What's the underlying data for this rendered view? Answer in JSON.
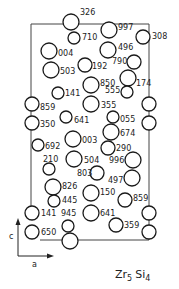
{
  "diagram": {
    "title": "Zr5Si4",
    "formula": {
      "el1": "Zr",
      "sub1": "5",
      "el2": "Si",
      "sub2": "4"
    },
    "axes": {
      "vertical": "c",
      "horizontal": "a"
    },
    "frame": {
      "x1": 31,
      "y1": 24,
      "x2": 149,
      "y2": 240
    },
    "atoms": [
      {
        "label": "326",
        "cx": 71,
        "cy": 22,
        "r": 8,
        "lx": 80,
        "ly": 15
      },
      {
        "label": "710",
        "cx": 74,
        "cy": 38,
        "r": 6,
        "lx": 82,
        "ly": 40
      },
      {
        "label": "997",
        "cx": 109,
        "cy": 30,
        "r": 8,
        "lx": 118,
        "ly": 30
      },
      {
        "label": "308",
        "cx": 143,
        "cy": 37,
        "r": 7,
        "lx": 152,
        "ly": 39
      },
      {
        "label": "496",
        "cx": 108,
        "cy": 50,
        "r": 8,
        "lx": 118,
        "ly": 50
      },
      {
        "label": "004",
        "cx": 49,
        "cy": 51,
        "r": 8,
        "lx": 58,
        "ly": 56
      },
      {
        "label": "503",
        "cx": 51,
        "cy": 70,
        "r": 8,
        "lx": 60,
        "ly": 74
      },
      {
        "label": "192",
        "cx": 85,
        "cy": 65,
        "r": 7,
        "lx": 92,
        "ly": 69
      },
      {
        "label": "790",
        "cx": 134,
        "cy": 62,
        "r": 7,
        "lx": 112,
        "ly": 64
      },
      {
        "label": "174",
        "cx": 128,
        "cy": 78,
        "r": 8,
        "lx": 136,
        "ly": 86
      },
      {
        "label": "850",
        "cx": 91,
        "cy": 85,
        "r": 8,
        "lx": 100,
        "ly": 86
      },
      {
        "label": "555",
        "cx": 127,
        "cy": 92,
        "r": 6,
        "lx": 105,
        "ly": 93
      },
      {
        "label": "141",
        "cx": 58,
        "cy": 93,
        "r": 6,
        "lx": 65,
        "ly": 96
      },
      {
        "label": "859",
        "cx": 32,
        "cy": 104,
        "r": 7,
        "lx": 40,
        "ly": 110
      },
      {
        "label": "355",
        "cx": 91,
        "cy": 104,
        "r": 8,
        "lx": 101,
        "ly": 108
      },
      {
        "label": "350",
        "cx": 32,
        "cy": 123,
        "r": 7,
        "lx": 40,
        "ly": 127
      },
      {
        "label": "641",
        "cx": 66,
        "cy": 117,
        "r": 6,
        "lx": 74,
        "ly": 123
      },
      {
        "label": "055",
        "cx": 113,
        "cy": 117,
        "r": 6,
        "lx": 120,
        "ly": 122
      },
      {
        "label": "674",
        "cx": 111,
        "cy": 132,
        "r": 8,
        "lx": 120,
        "ly": 136
      },
      {
        "label": "",
        "cx": 149,
        "cy": 104,
        "r": 7,
        "lx": 0,
        "ly": 0
      },
      {
        "label": "",
        "cx": 149,
        "cy": 123,
        "r": 7,
        "lx": 0,
        "ly": 0
      },
      {
        "label": "003",
        "cx": 73,
        "cy": 139,
        "r": 8,
        "lx": 82,
        "ly": 143
      },
      {
        "label": "692",
        "cx": 38,
        "cy": 145,
        "r": 6,
        "lx": 45,
        "ly": 149
      },
      {
        "label": "290",
        "cx": 108,
        "cy": 148,
        "r": 7,
        "lx": 116,
        "ly": 151
      },
      {
        "label": "210",
        "cx": 49,
        "cy": 169,
        "r": 6,
        "lx": 43,
        "ly": 162
      },
      {
        "label": "504",
        "cx": 74,
        "cy": 159,
        "r": 8,
        "lx": 84,
        "ly": 163
      },
      {
        "label": "996",
        "cx": 133,
        "cy": 160,
        "r": 8,
        "lx": 109,
        "ly": 163
      },
      {
        "label": "803",
        "cx": 97,
        "cy": 173,
        "r": 7,
        "lx": 77,
        "ly": 176
      },
      {
        "label": "497",
        "cx": 132,
        "cy": 178,
        "r": 8,
        "lx": 108,
        "ly": 183
      },
      {
        "label": "826",
        "cx": 53,
        "cy": 187,
        "r": 8,
        "lx": 62,
        "ly": 189
      },
      {
        "label": "445",
        "cx": 54,
        "cy": 201,
        "r": 6,
        "lx": 62,
        "ly": 203
      },
      {
        "label": "150",
        "cx": 91,
        "cy": 193,
        "r": 8,
        "lx": 100,
        "ly": 195
      },
      {
        "label": "859",
        "cx": 125,
        "cy": 200,
        "r": 7,
        "lx": 133,
        "ly": 201
      },
      {
        "label": "141",
        "cx": 32,
        "cy": 213,
        "r": 7,
        "lx": 41,
        "ly": 216
      },
      {
        "label": "945",
        "cx": 68,
        "cy": 226,
        "r": 6,
        "lx": 61,
        "ly": 216
      },
      {
        "label": "641",
        "cx": 91,
        "cy": 213,
        "r": 8,
        "lx": 100,
        "ly": 216
      },
      {
        "label": "359",
        "cx": 116,
        "cy": 225,
        "r": 7,
        "lx": 124,
        "ly": 228
      },
      {
        "label": "650",
        "cx": 32,
        "cy": 232,
        "r": 7,
        "lx": 41,
        "ly": 235
      },
      {
        "label": "",
        "cx": 70,
        "cy": 241,
        "r": 8,
        "lx": 0,
        "ly": 0
      },
      {
        "label": "",
        "cx": 149,
        "cy": 213,
        "r": 7,
        "lx": 0,
        "ly": 0
      },
      {
        "label": "",
        "cx": 149,
        "cy": 232,
        "r": 7,
        "lx": 0,
        "ly": 0
      }
    ]
  }
}
